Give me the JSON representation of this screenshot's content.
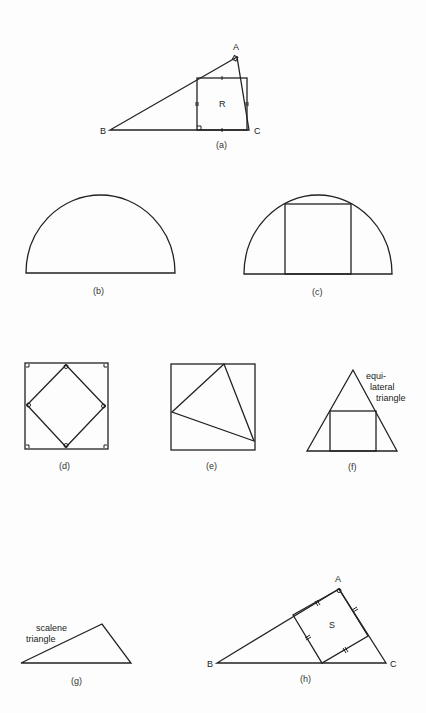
{
  "header": {
    "running_head": ""
  },
  "figures": {
    "a": {
      "caption": "(a)",
      "vertex_A": "A",
      "vertex_B": "B",
      "vertex_C": "C",
      "region": "R"
    },
    "b": {
      "caption": "(b)"
    },
    "c": {
      "caption": "(c)"
    },
    "d": {
      "caption": "(d)"
    },
    "e": {
      "caption": "(e)"
    },
    "f": {
      "caption": "(f)",
      "note_line1": "equi-",
      "note_line2": "lateral",
      "note_line3": "triangle"
    },
    "g": {
      "caption": "(g)",
      "note_line1": "scalene",
      "note_line2": "triangle"
    },
    "h": {
      "caption": "(h)",
      "vertex_A": "A",
      "vertex_B": "B",
      "vertex_C": "C",
      "region": "S"
    }
  },
  "colors": {
    "ink": "#222222",
    "paper": "#fdfdfd"
  }
}
